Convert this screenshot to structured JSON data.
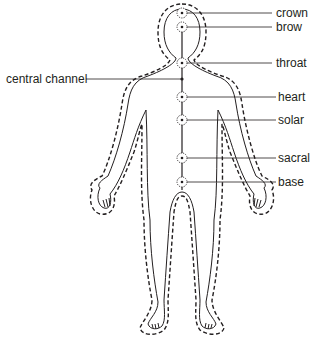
{
  "diagram": {
    "colors": {
      "ink": "#231f20",
      "background": "#ffffff"
    },
    "central_channel": {
      "label": "central channel"
    },
    "chakras": [
      {
        "name": "crown",
        "label": "crown"
      },
      {
        "name": "brow",
        "label": "brow"
      },
      {
        "name": "throat",
        "label": "throat"
      },
      {
        "name": "heart",
        "label": "heart"
      },
      {
        "name": "solar",
        "label": "solar"
      },
      {
        "name": "sacral",
        "label": "sacral"
      },
      {
        "name": "base",
        "label": "base"
      }
    ]
  }
}
